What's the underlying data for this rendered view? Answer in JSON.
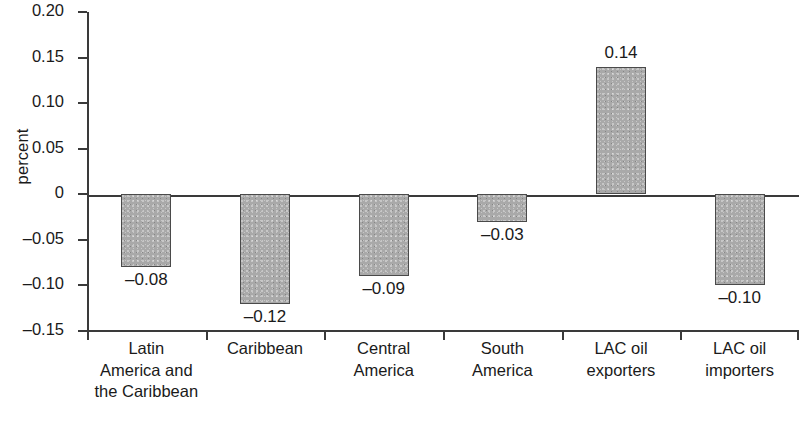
{
  "chart_data": {
    "type": "bar",
    "title": "",
    "subtitle": "",
    "xlabel": "",
    "ylabel": "percent",
    "categories": [
      "Latin\nAmerica and\nthe Caribbean",
      "Caribbean",
      "Central\nAmerica",
      "South\nAmerica",
      "LAC oil\nexporters",
      "LAC oil\nimporters"
    ],
    "values": [
      -0.08,
      -0.12,
      -0.09,
      -0.03,
      0.14,
      -0.1
    ],
    "value_labels": [
      "–0.08",
      "–0.12",
      "–0.09",
      "–0.03",
      "0.14",
      "–0.10"
    ],
    "ylim": [
      -0.15,
      0.2
    ],
    "yticks": [
      0.2,
      0.15,
      0.1,
      0.05,
      0,
      -0.05,
      -0.1,
      -0.15
    ],
    "ytick_labels": [
      "0.20",
      "0.15",
      "0.10",
      "0.05",
      "0",
      "–0.05",
      "–0.10",
      "–0.15"
    ],
    "grid": false,
    "legend": false,
    "legend_position": "none",
    "bar_fill_color": "#a9a9a9",
    "bar_edge_color": "#4a4a4a",
    "axis_color": "#3a3a3a",
    "background_color": "#ffffff"
  }
}
